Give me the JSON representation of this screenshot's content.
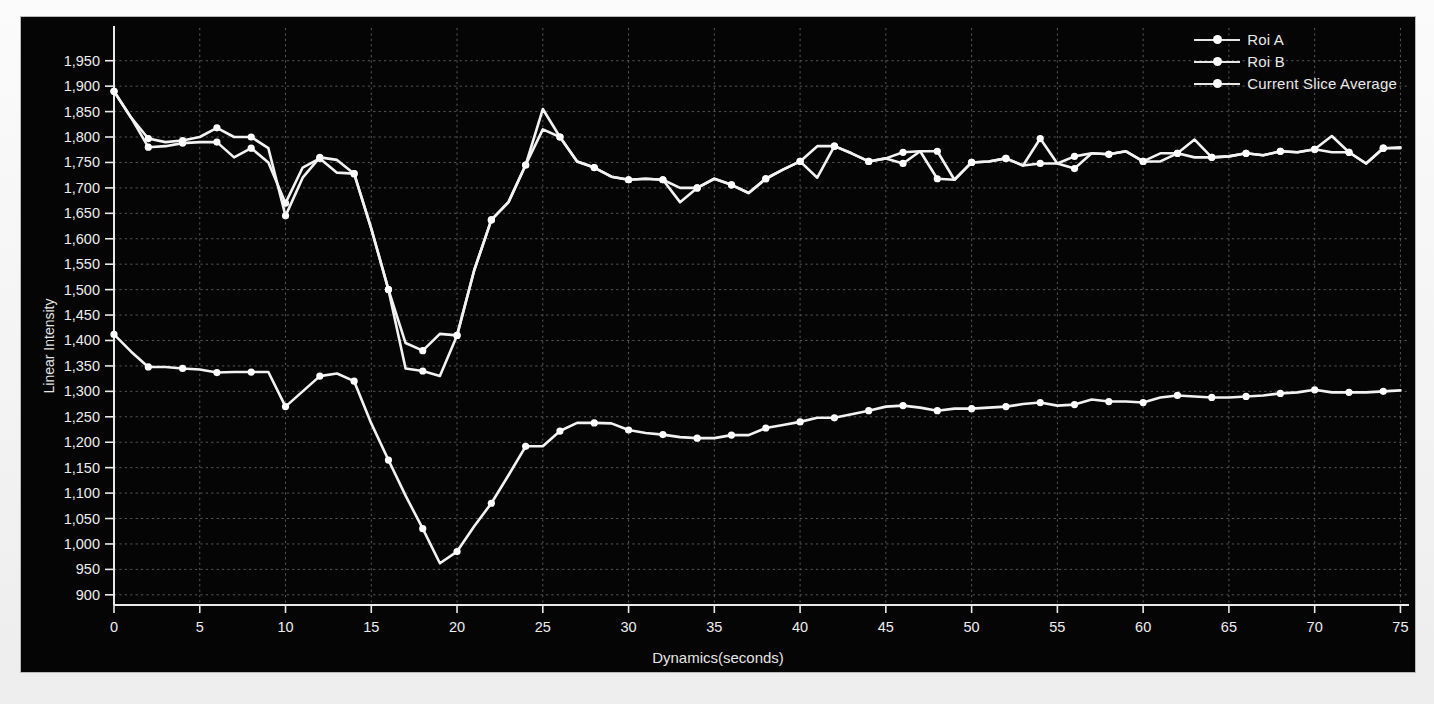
{
  "panel": {
    "background_color": "#050505",
    "foreground_color": "#ededed",
    "grid_color": "#585858"
  },
  "legend": {
    "position": "top-right",
    "items": [
      {
        "label": "Roi A",
        "marker": "line-with-dot",
        "color": "#f2f2f2"
      },
      {
        "label": "Roi B",
        "marker": "line-with-dot",
        "color": "#f2f2f2"
      },
      {
        "label": "Current Slice Average",
        "marker": "line-with-dot",
        "color": "#f2f2f2"
      }
    ]
  },
  "axes": {
    "x_title": "Dynamics(seconds)",
    "y_title": "Linear Intensity",
    "x_ticks": [
      0,
      5,
      10,
      15,
      20,
      25,
      30,
      35,
      40,
      45,
      50,
      55,
      60,
      65,
      70,
      75
    ],
    "x_tick_labels": [
      "0",
      "5",
      "10",
      "15",
      "20",
      "25",
      "30",
      "35",
      "40",
      "45",
      "50",
      "55",
      "60",
      "65",
      "70",
      "75"
    ],
    "y_ticks": [
      900,
      950,
      1000,
      1050,
      1100,
      1150,
      1200,
      1250,
      1300,
      1350,
      1400,
      1450,
      1500,
      1550,
      1600,
      1650,
      1700,
      1750,
      1800,
      1850,
      1900,
      1950
    ],
    "y_tick_labels": [
      "900",
      "950",
      "1,000",
      "1,050",
      "1,100",
      "1,150",
      "1,200",
      "1,250",
      "1,300",
      "1,350",
      "1,400",
      "1,450",
      "1,500",
      "1,550",
      "1,600",
      "1,650",
      "1,700",
      "1,750",
      "1,800",
      "1,850",
      "1,900",
      "1,950"
    ]
  },
  "chart_data": {
    "type": "line",
    "title": "",
    "subtitle": "",
    "xlabel": "Dynamics(seconds)",
    "ylabel": "Linear Intensity",
    "xlim": [
      0,
      75.5
    ],
    "ylim": [
      880,
      1975
    ],
    "grid": true,
    "legend_position": "top-right",
    "x": [
      0,
      1,
      2,
      3,
      4,
      5,
      6,
      7,
      8,
      9,
      10,
      11,
      12,
      13,
      14,
      15,
      16,
      17,
      18,
      19,
      20,
      21,
      22,
      23,
      24,
      25,
      26,
      27,
      28,
      29,
      30,
      31,
      32,
      33,
      34,
      35,
      36,
      37,
      38,
      39,
      40,
      41,
      42,
      43,
      44,
      45,
      46,
      47,
      48,
      49,
      50,
      51,
      52,
      53,
      54,
      55,
      56,
      57,
      58,
      59,
      60,
      61,
      62,
      63,
      64,
      65,
      66,
      67,
      68,
      69,
      70,
      71,
      72,
      73,
      74,
      75
    ],
    "series": [
      {
        "name": "Roi A",
        "color": "#f2f2f2",
        "values": [
          1890,
          1838,
          1797,
          1790,
          1793,
          1800,
          1818,
          1800,
          1800,
          1778,
          1645,
          1720,
          1760,
          1755,
          1728,
          1620,
          1500,
          1395,
          1380,
          1413,
          1410,
          1538,
          1637,
          1672,
          1745,
          1855,
          1800,
          1752,
          1740,
          1722,
          1716,
          1718,
          1716,
          1672,
          1700,
          1718,
          1706,
          1690,
          1718,
          1736,
          1752,
          1720,
          1782,
          1768,
          1752,
          1758,
          1748,
          1772,
          1772,
          1716,
          1750,
          1752,
          1758,
          1744,
          1797,
          1748,
          1762,
          1768,
          1766,
          1772,
          1752,
          1752,
          1768,
          1795,
          1760,
          1762,
          1768,
          1764,
          1772,
          1770,
          1776,
          1802,
          1770,
          1748,
          1778,
          1780
        ]
      },
      {
        "name": "Roi B",
        "color": "#f2f2f2",
        "values": [
          1890,
          1838,
          1780,
          1782,
          1788,
          1790,
          1790,
          1760,
          1778,
          1750,
          1670,
          1740,
          1758,
          1730,
          1728,
          1620,
          1500,
          1345,
          1340,
          1330,
          1410,
          1538,
          1637,
          1672,
          1745,
          1815,
          1800,
          1752,
          1740,
          1722,
          1716,
          1718,
          1716,
          1700,
          1700,
          1718,
          1706,
          1690,
          1718,
          1736,
          1752,
          1782,
          1782,
          1768,
          1752,
          1758,
          1770,
          1772,
          1718,
          1716,
          1750,
          1752,
          1758,
          1744,
          1748,
          1748,
          1738,
          1768,
          1766,
          1772,
          1752,
          1768,
          1768,
          1760,
          1760,
          1762,
          1768,
          1764,
          1772,
          1770,
          1776,
          1770,
          1770,
          1748,
          1778,
          1778
        ]
      },
      {
        "name": "Current Slice Average",
        "color": "#f2f2f2",
        "values": [
          1412,
          1378,
          1348,
          1348,
          1345,
          1343,
          1337,
          1338,
          1338,
          1338,
          1270,
          1300,
          1330,
          1335,
          1320,
          1237,
          1165,
          1095,
          1030,
          962,
          985,
          1035,
          1080,
          1135,
          1192,
          1192,
          1222,
          1238,
          1238,
          1237,
          1224,
          1218,
          1215,
          1210,
          1208,
          1208,
          1214,
          1214,
          1228,
          1234,
          1240,
          1248,
          1248,
          1255,
          1262,
          1270,
          1272,
          1268,
          1262,
          1266,
          1266,
          1268,
          1270,
          1275,
          1278,
          1272,
          1274,
          1284,
          1280,
          1280,
          1278,
          1288,
          1292,
          1290,
          1288,
          1288,
          1290,
          1292,
          1296,
          1298,
          1303,
          1298,
          1298,
          1298,
          1300,
          1302
        ]
      }
    ]
  }
}
